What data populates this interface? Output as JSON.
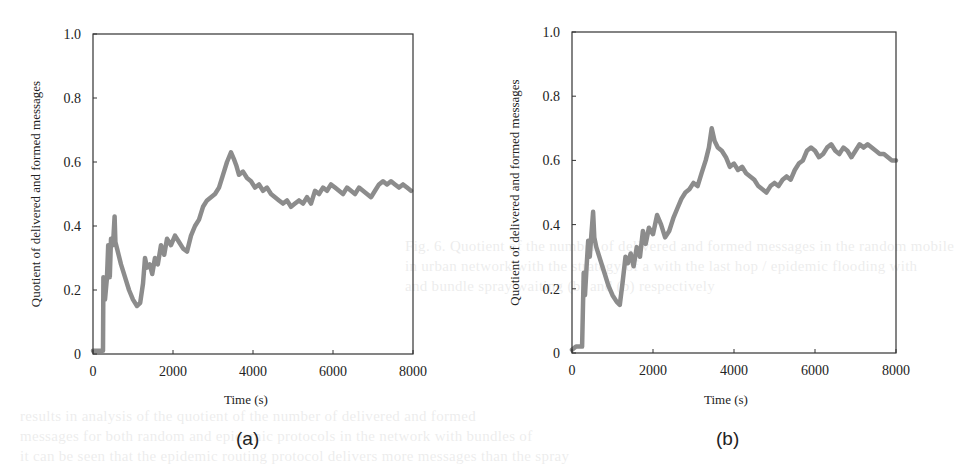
{
  "figure": {
    "panels": [
      {
        "id": "a",
        "caption": "(a)"
      },
      {
        "id": "b",
        "caption": "(b)"
      }
    ],
    "line_color": "#8c8c8c",
    "axis_color": "#333333"
  },
  "bleed_text": [
    "Fig. 6. Quotient of the number of delivered and formed messages in the random mobile",
    "in urban network with the strategy of a with the last hop / epidemic flooding with",
    "and bundle spray waiting (b) and (b) respectively",
    "results in analysis of the quotient of the number of delivered and formed",
    "messages for both random and epidemic protocols in the network with bundles of",
    "it can be seen that the epidemic routing protocol delivers more messages than the spray"
  ],
  "chart_data": [
    {
      "type": "line",
      "panel": "(a)",
      "title": "",
      "xlabel": "Time (s)",
      "ylabel": "Quotient of delivered and formed messages",
      "xlim": [
        0,
        8000
      ],
      "ylim": [
        0,
        1.0
      ],
      "xticks": [
        0,
        2000,
        4000,
        6000,
        8000
      ],
      "xtick_labels": [
        "0",
        "2000",
        "4000",
        "6000",
        "8000"
      ],
      "yticks": [
        0,
        0.2,
        0.4,
        0.6,
        0.8,
        1.0
      ],
      "ytick_labels": [
        "0",
        "0.2",
        "0.4",
        "0.6",
        "0.8",
        "1.0"
      ],
      "grid": false,
      "legend": null,
      "series": [
        {
          "name": "delivered/formed",
          "x": [
            0,
            250,
            260,
            300,
            350,
            380,
            420,
            450,
            500,
            540,
            560,
            600,
            700,
            800,
            900,
            1000,
            1100,
            1180,
            1250,
            1300,
            1350,
            1420,
            1480,
            1550,
            1620,
            1700,
            1780,
            1850,
            1950,
            2050,
            2150,
            2250,
            2350,
            2450,
            2550,
            2650,
            2750,
            2850,
            2950,
            3050,
            3150,
            3250,
            3350,
            3450,
            3520,
            3580,
            3650,
            3750,
            3850,
            3950,
            4050,
            4150,
            4250,
            4350,
            4450,
            4550,
            4650,
            4750,
            4850,
            4950,
            5050,
            5150,
            5250,
            5350,
            5450,
            5550,
            5650,
            5750,
            5850,
            5950,
            6050,
            6150,
            6250,
            6350,
            6450,
            6550,
            6650,
            6750,
            6850,
            6950,
            7050,
            7150,
            7250,
            7350,
            7450,
            7550,
            7650,
            7750,
            7850,
            7950
          ],
          "y": [
            0.01,
            0.01,
            0.24,
            0.17,
            0.24,
            0.34,
            0.24,
            0.36,
            0.34,
            0.43,
            0.35,
            0.33,
            0.28,
            0.24,
            0.2,
            0.17,
            0.15,
            0.16,
            0.22,
            0.3,
            0.27,
            0.28,
            0.25,
            0.3,
            0.28,
            0.34,
            0.31,
            0.36,
            0.34,
            0.37,
            0.35,
            0.33,
            0.32,
            0.37,
            0.4,
            0.42,
            0.46,
            0.48,
            0.49,
            0.5,
            0.52,
            0.56,
            0.6,
            0.63,
            0.61,
            0.59,
            0.56,
            0.57,
            0.55,
            0.54,
            0.52,
            0.53,
            0.51,
            0.52,
            0.5,
            0.49,
            0.48,
            0.47,
            0.48,
            0.46,
            0.47,
            0.48,
            0.47,
            0.49,
            0.47,
            0.51,
            0.5,
            0.52,
            0.51,
            0.53,
            0.52,
            0.51,
            0.5,
            0.52,
            0.51,
            0.5,
            0.52,
            0.51,
            0.5,
            0.49,
            0.51,
            0.53,
            0.54,
            0.53,
            0.54,
            0.53,
            0.52,
            0.53,
            0.52,
            0.51
          ]
        }
      ]
    },
    {
      "type": "line",
      "panel": "(b)",
      "title": "",
      "xlabel": "Time (s)",
      "ylabel": "Quotient of delivered and formed messages",
      "xlim": [
        0,
        8000
      ],
      "ylim": [
        0,
        1.0
      ],
      "xticks": [
        0,
        2000,
        4000,
        6000,
        8000
      ],
      "xtick_labels": [
        "0",
        "2000",
        "4000",
        "6000",
        "8000"
      ],
      "yticks": [
        0,
        0.2,
        0.4,
        0.6,
        0.8,
        1.0
      ],
      "ytick_labels": [
        "0",
        "0.2",
        "0.4",
        "0.6",
        "0.8",
        "1.0"
      ],
      "grid": false,
      "legend": null,
      "series": [
        {
          "name": "delivered/formed",
          "x": [
            0,
            100,
            250,
            290,
            320,
            360,
            400,
            440,
            480,
            520,
            550,
            600,
            700,
            800,
            900,
            1000,
            1100,
            1180,
            1250,
            1320,
            1380,
            1450,
            1520,
            1600,
            1680,
            1750,
            1820,
            1900,
            2000,
            2100,
            2200,
            2300,
            2400,
            2500,
            2600,
            2700,
            2800,
            2900,
            3000,
            3100,
            3200,
            3300,
            3380,
            3450,
            3520,
            3600,
            3700,
            3800,
            3900,
            4000,
            4100,
            4200,
            4300,
            4400,
            4500,
            4600,
            4700,
            4800,
            4900,
            5000,
            5100,
            5200,
            5300,
            5400,
            5500,
            5600,
            5700,
            5800,
            5900,
            6000,
            6100,
            6200,
            6300,
            6400,
            6500,
            6600,
            6700,
            6800,
            6900,
            7000,
            7100,
            7200,
            7300,
            7400,
            7500,
            7600,
            7700,
            7800,
            7900,
            8000
          ],
          "y": [
            0.01,
            0.02,
            0.02,
            0.25,
            0.18,
            0.27,
            0.35,
            0.3,
            0.37,
            0.44,
            0.36,
            0.33,
            0.29,
            0.25,
            0.21,
            0.18,
            0.16,
            0.15,
            0.22,
            0.3,
            0.28,
            0.31,
            0.27,
            0.33,
            0.3,
            0.38,
            0.34,
            0.39,
            0.37,
            0.43,
            0.4,
            0.36,
            0.38,
            0.42,
            0.45,
            0.48,
            0.5,
            0.51,
            0.53,
            0.52,
            0.56,
            0.6,
            0.64,
            0.7,
            0.66,
            0.64,
            0.63,
            0.61,
            0.58,
            0.59,
            0.57,
            0.58,
            0.56,
            0.55,
            0.54,
            0.52,
            0.51,
            0.5,
            0.52,
            0.53,
            0.52,
            0.54,
            0.55,
            0.54,
            0.57,
            0.59,
            0.6,
            0.63,
            0.64,
            0.63,
            0.61,
            0.62,
            0.64,
            0.65,
            0.63,
            0.62,
            0.64,
            0.63,
            0.61,
            0.63,
            0.65,
            0.64,
            0.65,
            0.64,
            0.63,
            0.62,
            0.62,
            0.61,
            0.6,
            0.6
          ]
        }
      ]
    }
  ]
}
